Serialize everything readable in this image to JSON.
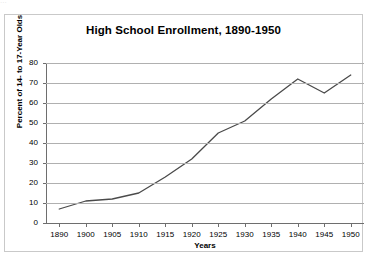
{
  "top_sliver": {
    "text": "..."
  },
  "chart_data": {
    "type": "line",
    "title": "High School Enrollment, 1890-1950",
    "xlabel": "Years",
    "ylabel": "Percent of 14- to 17-Year Olds",
    "categories": [
      "1890",
      "1900",
      "1905",
      "1910",
      "1915",
      "1920",
      "1925",
      "1930",
      "1935",
      "1940",
      "1945",
      "1950"
    ],
    "values": [
      7,
      11,
      12,
      15,
      23,
      32,
      45,
      51,
      62,
      72,
      65,
      74
    ],
    "series": [
      {
        "name": "Percent enrolled",
        "values": [
          7,
          11,
          12,
          15,
          23,
          32,
          45,
          51,
          62,
          72,
          65,
          74
        ],
        "color": "#4a4a4a"
      }
    ],
    "ylim": [
      0,
      80
    ],
    "yticks": [
      0,
      10,
      20,
      30,
      40,
      50,
      60,
      70,
      80
    ],
    "grid": true,
    "legend": false,
    "legend_position": "none",
    "line_color": "#4a4a4a",
    "grid_color": "#b0b0b0",
    "axis_color": "#6e6e6e",
    "background_color": "#ffffff",
    "border_color": "#c9c9c9"
  }
}
